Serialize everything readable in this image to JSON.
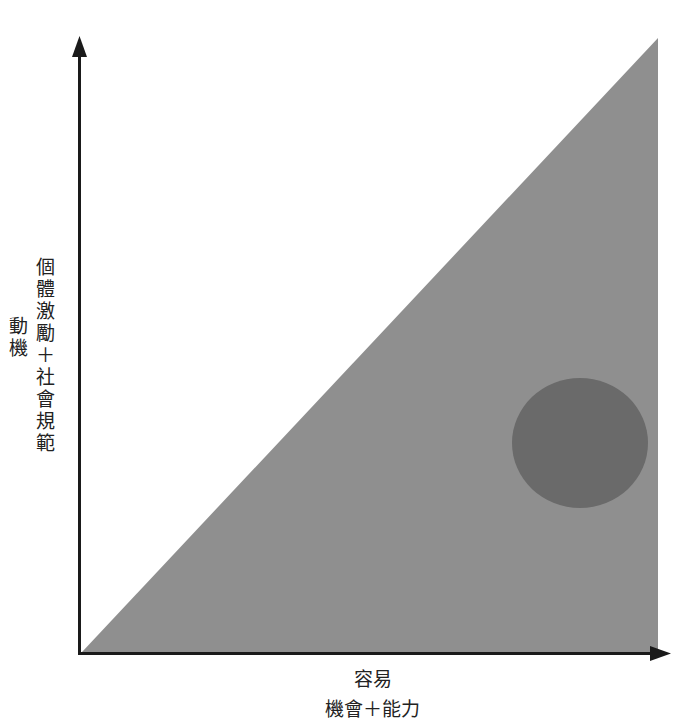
{
  "diagram": {
    "type": "behavior-model-triangle",
    "y_axis": {
      "label": "動機",
      "sublabel": "個體激勵＋社會規範"
    },
    "x_axis": {
      "label": "容易",
      "sublabel": "機會＋能力"
    },
    "colors": {
      "background": "#ffffff",
      "axis": "#1a1a1a",
      "triangle_fill": "#8f8f8f",
      "circle_fill": "#6a6a6a"
    },
    "shapes": {
      "triangle": {
        "points": [
          [
            82,
            652
          ],
          [
            658,
            38
          ],
          [
            658,
            652
          ]
        ]
      },
      "circle": {
        "cx": 580,
        "cy": 443,
        "rx": 68,
        "ry": 65
      }
    }
  }
}
